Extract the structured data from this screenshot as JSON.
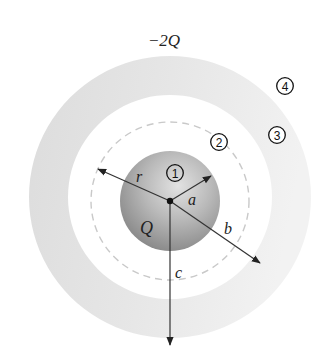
{
  "diagram": {
    "title": "−2Q",
    "inner_sphere": {
      "charge_label": "Q",
      "region": "1"
    },
    "regions": [
      {
        "id": "region-1",
        "label": "1"
      },
      {
        "id": "region-2",
        "label": "2"
      },
      {
        "id": "region-3",
        "label": "3"
      },
      {
        "id": "region-4",
        "label": "4"
      }
    ],
    "radii_labels": {
      "r": "r",
      "a": "a",
      "b": "b",
      "c": "c"
    },
    "colors": {
      "sphere_light": "#dcdcdc",
      "sphere_dark": "#858585",
      "shell_left": "#dedede",
      "shell_right": "#f1f1f1",
      "dashed": "#c8c8c8",
      "line": "#333333"
    }
  }
}
